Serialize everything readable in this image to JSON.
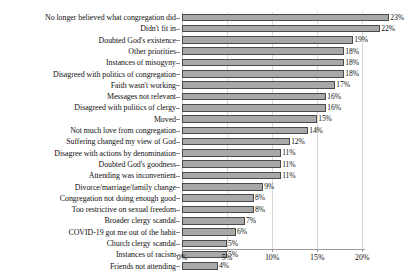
{
  "chart_data": {
    "type": "bar",
    "orientation": "horizontal",
    "title": "",
    "subtitle": "",
    "xlabel": "",
    "ylabel": "",
    "xlim": [
      0,
      20.3
    ],
    "grid": true,
    "gridlines_axis": "x",
    "legend": false,
    "legend_position": "none",
    "value_label_suffix": "%",
    "bar_color": "#a8a8a8",
    "bar_edge_color": "#4a4a4a",
    "x_ticks": [
      "0%",
      "5%",
      "10%",
      "15%",
      "20%"
    ],
    "x_tick_values": [
      0,
      5,
      10,
      15,
      20
    ],
    "categories": [
      "No longer believed what congregation did",
      "Didn't fit in",
      "Doubted God's existence",
      "Other priorities",
      "Instances of misogyny",
      "Disagreed with politics of congregation",
      "Faith wasn't working",
      "Messages not relevant",
      "Disagreed with politics of clergy",
      "Moved",
      "Not much love from congregation",
      "Suffering changed my view of God",
      "Disagree with actions by denomination",
      "Doubted God's goodness",
      "Attending was inconvenient",
      "Divorce/marriage/family change",
      "Congregation not doing enough good",
      "Too restrictive on sexual freedom",
      "Broader clergy scandal",
      "COVID-19 got me out of the habit",
      "Church clergy scandal",
      "Instances of racism",
      "Friends not attending"
    ],
    "values": [
      23,
      22,
      19,
      18,
      18,
      18,
      17,
      16,
      16,
      15,
      14,
      12,
      11,
      11,
      11,
      9,
      8,
      8,
      7,
      6,
      5,
      5,
      4
    ],
    "value_labels": [
      "23%",
      "22%",
      "19%",
      "18%",
      "18%",
      "18%",
      "17%",
      "16%",
      "16%",
      "15%",
      "14%",
      "12%",
      "11%",
      "11%",
      "11%",
      "9%",
      "8%",
      "8%",
      "7%",
      "6%",
      "5%",
      "5%",
      "4%"
    ]
  }
}
